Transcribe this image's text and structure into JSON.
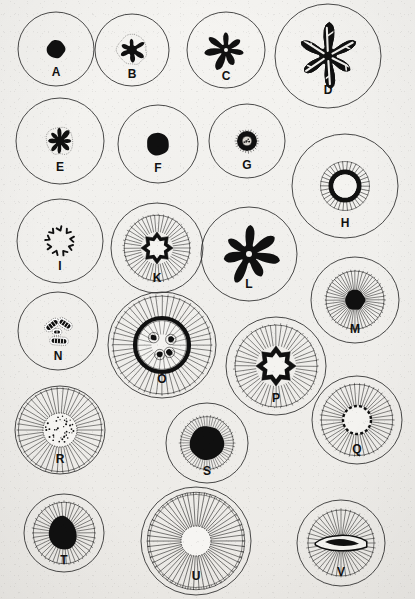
{
  "plate": {
    "title": "Mitosis stages plate",
    "background_color": "#f1f0ed",
    "ink_color": "#101010",
    "outline_color": "#2a2a2a",
    "label_color": "#111111",
    "width": 415,
    "height": 599,
    "panel_count": 22
  },
  "figures": [
    {
      "label": "A",
      "cx": 56,
      "cy": 49,
      "r": 38,
      "rx": 38,
      "ry": 37,
      "kind": "solid-blob",
      "core": 9,
      "label_dx": 0,
      "label_dy": 17,
      "label_size": 12,
      "desc": "resting nucleus, dense round chromatin mass"
    },
    {
      "label": "B",
      "cx": 132,
      "cy": 50,
      "r": 37,
      "rx": 37,
      "ry": 36,
      "kind": "asterisk-small",
      "core": 14,
      "arms": 6,
      "label_dx": 0,
      "label_dy": 18,
      "label_size": 12,
      "desc": "early prophase, stellate chromatin"
    },
    {
      "label": "C",
      "cx": 226,
      "cy": 50,
      "r": 39,
      "rx": 39,
      "ry": 38,
      "kind": "asterisk-solid",
      "core": 20,
      "arms": 7,
      "label_dx": 0,
      "label_dy": 20,
      "label_size": 12,
      "desc": "prophase, thickened spireme star"
    },
    {
      "label": "D",
      "cx": 328,
      "cy": 56,
      "r": 53,
      "rx": 53,
      "ry": 52,
      "kind": "dendritic",
      "core": 32,
      "arms": 6,
      "label_dx": 0,
      "label_dy": 28,
      "label_size": 12,
      "desc": "prophase, outlined branched spireme"
    },
    {
      "label": "E",
      "cx": 60,
      "cy": 141,
      "r": 44,
      "rx": 44,
      "ry": 43,
      "kind": "asterisk-small",
      "core": 13,
      "arms": 8,
      "label_dx": 0,
      "label_dy": 20,
      "label_size": 12,
      "desc": "contracted chromatin star"
    },
    {
      "label": "F",
      "cx": 158,
      "cy": 144,
      "r": 40,
      "rx": 40,
      "ry": 39,
      "kind": "solid-blob",
      "core": 11,
      "arms": 0,
      "label_dx": 0,
      "label_dy": 18,
      "label_size": 12,
      "desc": "condensed nuclear mass"
    },
    {
      "label": "G",
      "cx": 247,
      "cy": 141,
      "r": 38,
      "rx": 38,
      "ry": 37,
      "kind": "dense-ring",
      "core": 10,
      "arms": 0,
      "label_dx": 0,
      "label_dy": 18,
      "label_size": 12,
      "desc": "small dense ring, karyosphere"
    },
    {
      "label": "H",
      "cx": 345,
      "cy": 186,
      "r": 53,
      "rx": 53,
      "ry": 52,
      "kind": "ring-radial",
      "core": 14,
      "arms": 34,
      "label_dx": 0,
      "label_dy": 31,
      "label_size": 12,
      "desc": "thick black ring with short radial fibres"
    },
    {
      "label": "I",
      "cx": 60,
      "cy": 241,
      "r": 43,
      "rx": 43,
      "ry": 42,
      "kind": "scattered-v",
      "core": 16,
      "arms": 9,
      "label_dx": 0,
      "label_dy": 19,
      "label_size": 12,
      "desc": "separate V-shaped chromosomes in a circle"
    },
    {
      "label": "K",
      "cx": 157,
      "cy": 248,
      "r": 46,
      "rx": 46,
      "ry": 45,
      "kind": "star-ring-radial",
      "core": 16,
      "arms": 46,
      "label_dx": 0,
      "label_dy": 24,
      "label_size": 12,
      "desc": "stellate plate with radiating astral rays"
    },
    {
      "label": "L",
      "cx": 249,
      "cy": 254,
      "r": 48,
      "rx": 48,
      "ry": 47,
      "kind": "asterisk-solid",
      "core": 30,
      "arms": 7,
      "label_dx": 0,
      "label_dy": 24,
      "label_size": 12,
      "desc": "heavy starfish chromatin figure"
    },
    {
      "label": "M",
      "cx": 355,
      "cy": 300,
      "r": 44,
      "rx": 44,
      "ry": 43,
      "kind": "radial-dark-core",
      "core": 10,
      "arms": 48,
      "label_dx": 0,
      "label_dy": 23,
      "label_size": 12,
      "desc": "aster with solid central body"
    },
    {
      "label": "N",
      "cx": 58,
      "cy": 331,
      "r": 40,
      "rx": 40,
      "ry": 39,
      "kind": "chromosome-pairs",
      "core": 20,
      "arms": 4,
      "label_dx": 0,
      "label_dy": 19,
      "label_size": 12,
      "desc": "outlined paired chromosomes"
    },
    {
      "label": "O",
      "cx": 162,
      "cy": 345,
      "r": 54,
      "rx": 54,
      "ry": 53,
      "kind": "thick-band-ring",
      "core": 20,
      "arms": 52,
      "label_dx": 0,
      "label_dy": 28,
      "label_size": 12,
      "desc": "equatorial plate seen in polar view"
    },
    {
      "label": "P",
      "cx": 276,
      "cy": 366,
      "r": 50,
      "rx": 50,
      "ry": 49,
      "kind": "star-ring-radial",
      "core": 20,
      "arms": 48,
      "label_dx": 0,
      "label_dy": 26,
      "label_size": 12,
      "desc": "ring of chromosomes with spindle rays"
    },
    {
      "label": "Q",
      "cx": 357,
      "cy": 420,
      "r": 45,
      "rx": 45,
      "ry": 44,
      "kind": "dashed-ring-radial",
      "core": 14,
      "arms": 46,
      "label_dx": 0,
      "label_dy": 23,
      "label_size": 12,
      "desc": "dotted chromosome ring with rays"
    },
    {
      "label": "R",
      "cx": 60,
      "cy": 430,
      "r": 45,
      "rx": 45,
      "ry": 44,
      "kind": "speckled-radial",
      "core": 17,
      "arms": 46,
      "label_dx": 0,
      "label_dy": 23,
      "label_size": 12,
      "desc": "granular plate with radiating fibres"
    },
    {
      "label": "S",
      "cx": 207,
      "cy": 443,
      "r": 41,
      "rx": 41,
      "ry": 40,
      "kind": "blob-corona",
      "core": 17,
      "arms": 52,
      "label_dx": 0,
      "label_dy": 22,
      "label_size": 12,
      "desc": "dense mass surrounded by corona"
    },
    {
      "label": "T",
      "cx": 64,
      "cy": 533,
      "r": 40,
      "rx": 40,
      "ry": 39,
      "kind": "blob-radial",
      "core": 15,
      "arms": 42,
      "label_dx": 0,
      "label_dy": 21,
      "label_size": 12,
      "desc": "irregular mass within radiating zone"
    },
    {
      "label": "U",
      "cx": 196,
      "cy": 541,
      "r": 55,
      "rx": 55,
      "ry": 54,
      "kind": "wheel-spokes",
      "core": 15,
      "arms": 54,
      "label_dx": 0,
      "label_dy": 29,
      "label_size": 12,
      "desc": "large aster with long spokes"
    },
    {
      "label": "V",
      "cx": 341,
      "cy": 543,
      "r": 44,
      "rx": 44,
      "ry": 43,
      "kind": "spindle-plate",
      "core": 28,
      "arms": 44,
      "label_dx": 0,
      "label_dy": 23,
      "label_size": 12,
      "desc": "spindle with equatorial plate in side view"
    }
  ]
}
